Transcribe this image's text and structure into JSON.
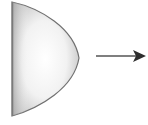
{
  "diagram": {
    "shape": {
      "kind": "half-paraboloid",
      "fill_light": "#ffffff",
      "fill_dark": "#b8b8b8",
      "stroke": "#6e6e6e"
    },
    "arrow": {
      "direction": "right",
      "color": "#3a3a3a"
    }
  }
}
